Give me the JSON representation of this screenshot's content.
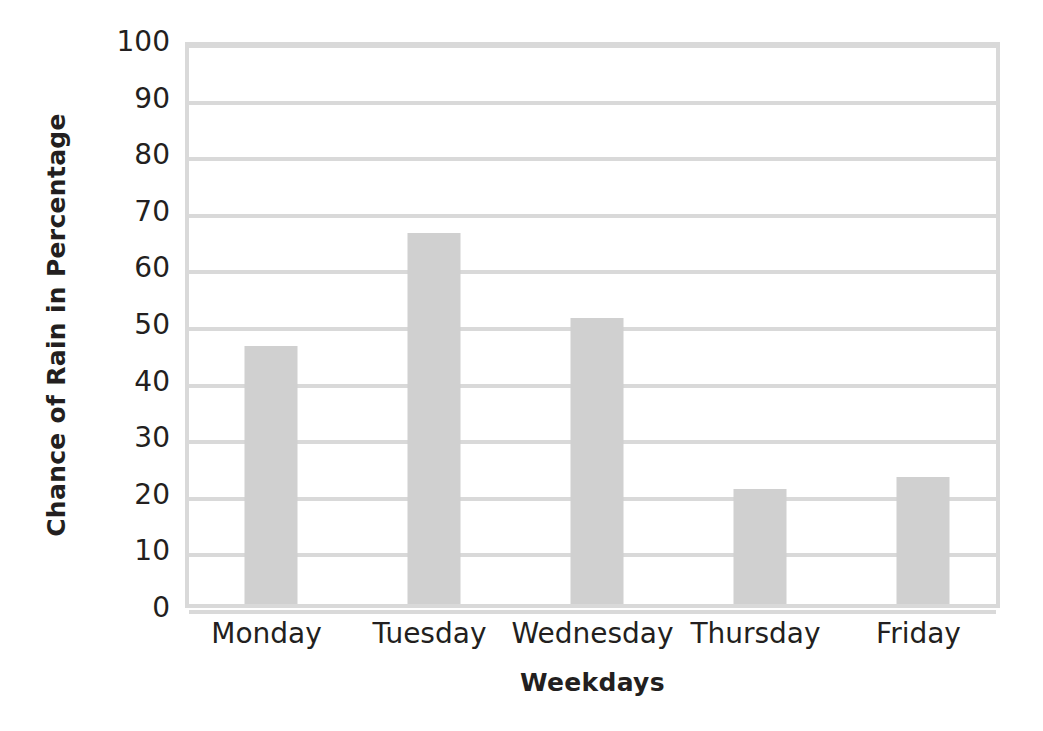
{
  "chart_data": {
    "type": "bar",
    "title": "",
    "categories": [
      "Monday",
      "Tuesday",
      "Wednesday",
      "Thursday",
      "Friday"
    ],
    "values": [
      45.5,
      65.5,
      50.5,
      20.3,
      22.5
    ],
    "series": [
      {
        "name": "Chance of Rain",
        "values": [
          45.5,
          65.5,
          50.5,
          20.3,
          22.5
        ]
      }
    ],
    "xlabel": "Weekdays",
    "ylabel": "Chance of Rain in Percentage",
    "ylim": [
      0,
      100
    ],
    "yticks": [
      0,
      10,
      20,
      30,
      40,
      50,
      60,
      70,
      80,
      90,
      100
    ],
    "ytick_labels": [
      "0",
      "10",
      "20",
      "30",
      "40",
      "50",
      "60",
      "70",
      "80",
      "90",
      "100"
    ],
    "grid": true,
    "grid_axis": "y",
    "legend": false,
    "legend_position": "none",
    "bar_color": "#d0d0d0",
    "gridline_color": "#d9d9d9",
    "axis_color": "#d9d9d9",
    "text_color": "#231f20",
    "background_color": "#ffffff"
  }
}
